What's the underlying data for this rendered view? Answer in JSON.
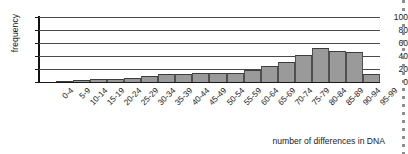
{
  "chart_data": {
    "type": "bar",
    "title": "",
    "xlabel": "number of differences in DNA",
    "ylabel": "frequency",
    "ylim": [
      0,
      100
    ],
    "yticks": [
      0,
      20,
      40,
      60,
      80,
      100
    ],
    "grid": true,
    "legend": null,
    "categories": [
      "0-4",
      "5-9",
      "10-14",
      "15-19",
      "20-24",
      "25-29",
      "30-34",
      "35-39",
      "40-44",
      "45-49",
      "50-54",
      "55-59",
      "60-64",
      "65-69",
      "70-74",
      "75-79",
      "80-84",
      "85-89",
      "90-94",
      "95-99"
    ],
    "values": [
      0,
      1,
      3,
      4,
      4,
      6,
      9,
      12,
      13,
      14,
      14,
      14,
      18,
      24,
      31,
      41,
      53,
      47,
      46,
      13
    ]
  }
}
